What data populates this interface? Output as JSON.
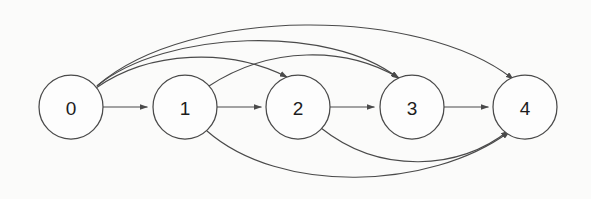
{
  "diagram": {
    "type": "directed-graph",
    "background_color": "#fbfbfa",
    "node_fill_color": "#fdfdfd",
    "node_stroke_color": "#4a4a4a",
    "edge_color": "#4a4a4a",
    "label_color": "#1c1c1c",
    "node_radius": 32,
    "nodes": [
      {
        "id": "0",
        "label": "0",
        "cx": 71,
        "cy": 107
      },
      {
        "id": "1",
        "label": "1",
        "cx": 185,
        "cy": 107
      },
      {
        "id": "2",
        "label": "2",
        "cx": 298,
        "cy": 107
      },
      {
        "id": "3",
        "label": "3",
        "cx": 412,
        "cy": 107
      },
      {
        "id": "4",
        "label": "4",
        "cx": 525,
        "cy": 107
      }
    ],
    "edges": [
      {
        "from": "0",
        "to": "1",
        "style": "straight",
        "side": "middle",
        "path": "M 103 107 L 147 107"
      },
      {
        "from": "0",
        "to": "2",
        "style": "curved",
        "side": "top",
        "path": "M 96 88 C 150 50 230 48 287 77"
      },
      {
        "from": "0",
        "to": "3",
        "style": "curved",
        "side": "top",
        "path": "M 97 86 C 165 30 330 24 398 78"
      },
      {
        "from": "0",
        "to": "4",
        "style": "curved",
        "side": "top",
        "path": "M 98 85 C 190 6 420 6 513 79"
      },
      {
        "from": "1",
        "to": "2",
        "style": "straight",
        "side": "middle",
        "path": "M 217 107 L 261 107"
      },
      {
        "from": "1",
        "to": "3",
        "style": "curved",
        "side": "top",
        "path": "M 209 86 C 270 46 345 46 399 78"
      },
      {
        "from": "1",
        "to": "4",
        "style": "curved",
        "side": "bottom",
        "path": "M 207 131 C 280 195 430 190 509 132"
      },
      {
        "from": "2",
        "to": "3",
        "style": "straight",
        "side": "middle",
        "path": "M 330 107 L 374 107"
      },
      {
        "from": "2",
        "to": "4",
        "style": "curved",
        "side": "bottom",
        "path": "M 321 128 C 380 175 460 170 508 131"
      },
      {
        "from": "3",
        "to": "4",
        "style": "straight",
        "side": "middle",
        "path": "M 444 107 L 488 107"
      }
    ],
    "arrowhead": {
      "name": "arrowhead-marker",
      "width": 7,
      "height": 5
    }
  }
}
